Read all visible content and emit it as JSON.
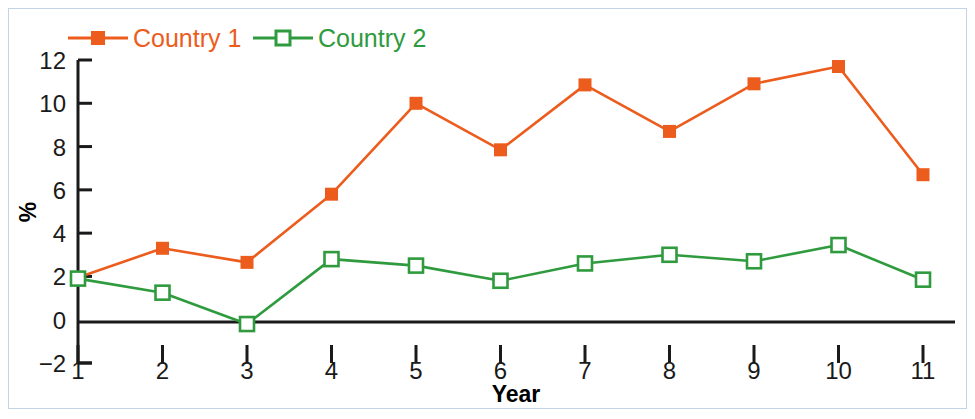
{
  "figure": {
    "frame_color": "#c3d3e4",
    "background": "#ffffff"
  },
  "legend": {
    "position": "top-left",
    "entries": [
      {
        "label": "Country 1",
        "color": "#ec5c1c",
        "marker": "filled-square"
      },
      {
        "label": "Country 2",
        "color": "#2f9b3e",
        "marker": "open-square"
      }
    ]
  },
  "axes": {
    "y_label": "%",
    "x_label": "Year",
    "y_ticks": [
      "12",
      "10",
      "8",
      "6",
      "4",
      "2",
      "0",
      "−2"
    ],
    "x_ticks": [
      "1",
      "2",
      "3",
      "4",
      "5",
      "6",
      "7",
      "8",
      "9",
      "10",
      "11"
    ]
  },
  "chart_data": {
    "type": "line",
    "title": "",
    "subtitle": "",
    "xlabel": "Year",
    "ylabel": "%",
    "categories": [
      1,
      2,
      3,
      4,
      5,
      6,
      7,
      8,
      9,
      10,
      11
    ],
    "x": [
      1,
      2,
      3,
      4,
      5,
      6,
      7,
      8,
      9,
      10,
      11
    ],
    "xlim": [
      1,
      11
    ],
    "ylim": [
      -2,
      12
    ],
    "y_tick_values": [
      -2,
      0,
      2,
      4,
      6,
      8,
      10,
      12
    ],
    "x_tick_values": [
      1,
      2,
      3,
      4,
      5,
      6,
      7,
      8,
      9,
      10,
      11
    ],
    "grid": false,
    "legend_position": "top-left",
    "zero_line": true,
    "series": [
      {
        "name": "Country 1",
        "color": "#ec5c1c",
        "marker": "filled-square",
        "values": [
          1.95,
          3.3,
          2.65,
          5.8,
          10.0,
          7.85,
          10.85,
          8.7,
          10.9,
          11.7,
          6.7
        ]
      },
      {
        "name": "Country 2",
        "color": "#2f9b3e",
        "marker": "open-square",
        "values": [
          1.9,
          1.25,
          -0.2,
          2.8,
          2.5,
          1.8,
          2.6,
          3.0,
          2.7,
          3.45,
          1.85
        ]
      }
    ]
  }
}
